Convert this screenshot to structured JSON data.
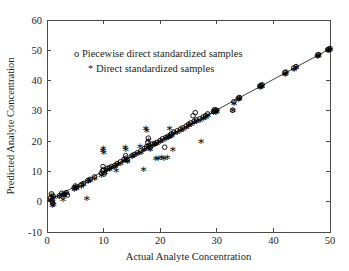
{
  "chart_data": {
    "type": "scatter",
    "title": "",
    "xlabel": "Actual Analyte Concentration",
    "ylabel": "Predicted Analyte Concentration",
    "xlim": [
      0,
      50
    ],
    "ylim": [
      -10,
      60
    ],
    "xticks": [
      0,
      10,
      20,
      30,
      40,
      50
    ],
    "yticks": [
      -10,
      0,
      10,
      20,
      30,
      40,
      50,
      60
    ],
    "xtick_labels": [
      "0",
      "10",
      "20",
      "30",
      "40",
      "50"
    ],
    "ytick_labels": [
      "-10",
      "0",
      "10",
      "20",
      "30",
      "40",
      "50",
      "60"
    ],
    "grid": false,
    "legend_position": "upper-left-inside",
    "legend": [
      {
        "marker": "o",
        "label": "Piecewise direct standardized samples"
      },
      {
        "marker": "*",
        "label": "Direct standardized samples"
      }
    ],
    "reference_line": {
      "type": "identity",
      "x": [
        0,
        50
      ],
      "y": [
        0,
        50.5
      ]
    },
    "series": [
      {
        "name": "Piecewise direct standardized samples",
        "marker": "o",
        "points": [
          [
            0.6,
            1.2
          ],
          [
            0.8,
            2.6
          ],
          [
            0.9,
            0.2
          ],
          [
            1.0,
            -0.6
          ],
          [
            1.1,
            1.8
          ],
          [
            2.2,
            2.0
          ],
          [
            2.6,
            2.8
          ],
          [
            3.0,
            2.4
          ],
          [
            3.4,
            3.0
          ],
          [
            3.6,
            2.2
          ],
          [
            4.8,
            4.6
          ],
          [
            5.0,
            5.2
          ],
          [
            5.2,
            4.8
          ],
          [
            6.0,
            5.6
          ],
          [
            6.4,
            6.0
          ],
          [
            7.2,
            7.0
          ],
          [
            7.6,
            7.4
          ],
          [
            8.4,
            8.2
          ],
          [
            9.6,
            9.4
          ],
          [
            9.8,
            10.2
          ],
          [
            9.9,
            11.6
          ],
          [
            10.0,
            10.6
          ],
          [
            10.1,
            9.2
          ],
          [
            10.6,
            11.0
          ],
          [
            11.0,
            11.2
          ],
          [
            11.4,
            11.6
          ],
          [
            12.0,
            12.0
          ],
          [
            12.4,
            12.6
          ],
          [
            13.0,
            13.2
          ],
          [
            13.6,
            14.0
          ],
          [
            13.9,
            15.2
          ],
          [
            14.0,
            14.4
          ],
          [
            14.2,
            13.8
          ],
          [
            15.0,
            15.2
          ],
          [
            15.4,
            15.6
          ],
          [
            16.0,
            16.2
          ],
          [
            16.6,
            16.8
          ],
          [
            17.2,
            17.6
          ],
          [
            17.6,
            18.2
          ],
          [
            17.8,
            19.6
          ],
          [
            17.9,
            21.0
          ],
          [
            18.0,
            18.6
          ],
          [
            18.2,
            17.8
          ],
          [
            18.6,
            19.0
          ],
          [
            19.0,
            19.2
          ],
          [
            19.4,
            19.6
          ],
          [
            20.0,
            20.2
          ],
          [
            20.4,
            20.8
          ],
          [
            20.8,
            18.0
          ],
          [
            21.0,
            21.2
          ],
          [
            21.4,
            21.6
          ],
          [
            21.8,
            22.0
          ],
          [
            22.0,
            22.4
          ],
          [
            22.4,
            23.0
          ],
          [
            23.0,
            23.4
          ],
          [
            23.6,
            24.0
          ],
          [
            24.0,
            24.4
          ],
          [
            24.6,
            25.0
          ],
          [
            25.0,
            25.6
          ],
          [
            25.4,
            26.0
          ],
          [
            25.8,
            28.4
          ],
          [
            26.0,
            26.6
          ],
          [
            26.2,
            29.4
          ],
          [
            26.4,
            27.0
          ],
          [
            27.0,
            27.4
          ],
          [
            27.6,
            28.0
          ],
          [
            28.0,
            28.4
          ],
          [
            28.4,
            29.0
          ],
          [
            29.4,
            29.8
          ],
          [
            29.6,
            30.4
          ],
          [
            29.8,
            30.0
          ],
          [
            30.0,
            30.2
          ],
          [
            32.8,
            30.2
          ],
          [
            33.0,
            33.0
          ],
          [
            33.8,
            34.2
          ],
          [
            34.0,
            34.4
          ],
          [
            37.6,
            38.2
          ],
          [
            37.8,
            38.4
          ],
          [
            38.0,
            38.6
          ],
          [
            42.0,
            42.6
          ],
          [
            42.2,
            42.8
          ],
          [
            43.6,
            44.2
          ],
          [
            44.0,
            44.6
          ],
          [
            47.8,
            48.4
          ],
          [
            48.0,
            48.6
          ],
          [
            49.6,
            50.2
          ],
          [
            49.8,
            50.4
          ],
          [
            50.0,
            50.6
          ]
        ]
      },
      {
        "name": "Direct standardized samples",
        "marker": "*",
        "points": [
          [
            0.6,
            1.0
          ],
          [
            0.7,
            2.4
          ],
          [
            0.9,
            -1.0
          ],
          [
            1.0,
            0.4
          ],
          [
            1.1,
            -0.8
          ],
          [
            1.2,
            1.6
          ],
          [
            2.2,
            1.8
          ],
          [
            2.6,
            2.6
          ],
          [
            2.8,
            1.0
          ],
          [
            3.0,
            2.2
          ],
          [
            3.4,
            2.8
          ],
          [
            4.8,
            4.4
          ],
          [
            5.0,
            5.0
          ],
          [
            5.2,
            4.6
          ],
          [
            6.0,
            5.4
          ],
          [
            6.4,
            5.8
          ],
          [
            7.0,
            1.4
          ],
          [
            7.2,
            6.8
          ],
          [
            7.6,
            7.2
          ],
          [
            8.4,
            8.0
          ],
          [
            9.6,
            9.0
          ],
          [
            9.8,
            17.2
          ],
          [
            9.9,
            17.8
          ],
          [
            10.0,
            16.6
          ],
          [
            10.1,
            10.0
          ],
          [
            10.2,
            9.8
          ],
          [
            10.6,
            10.8
          ],
          [
            11.0,
            11.0
          ],
          [
            11.4,
            11.4
          ],
          [
            12.0,
            11.8
          ],
          [
            12.2,
            10.6
          ],
          [
            12.4,
            12.4
          ],
          [
            13.0,
            13.0
          ],
          [
            13.6,
            13.8
          ],
          [
            13.8,
            18.0
          ],
          [
            13.9,
            17.4
          ],
          [
            14.0,
            14.2
          ],
          [
            14.2,
            13.6
          ],
          [
            15.0,
            15.0
          ],
          [
            15.4,
            15.4
          ],
          [
            16.0,
            16.0
          ],
          [
            16.4,
            18.4
          ],
          [
            16.6,
            16.6
          ],
          [
            17.0,
            10.8
          ],
          [
            17.2,
            17.4
          ],
          [
            17.4,
            24.4
          ],
          [
            17.6,
            23.6
          ],
          [
            17.8,
            18.0
          ],
          [
            17.9,
            20.6
          ],
          [
            18.0,
            18.4
          ],
          [
            18.2,
            17.6
          ],
          [
            18.6,
            18.8
          ],
          [
            19.0,
            19.0
          ],
          [
            19.2,
            14.6
          ],
          [
            19.4,
            19.4
          ],
          [
            19.6,
            14.4
          ],
          [
            20.0,
            20.0
          ],
          [
            20.2,
            14.8
          ],
          [
            20.4,
            20.6
          ],
          [
            20.6,
            14.6
          ],
          [
            21.0,
            21.0
          ],
          [
            21.2,
            14.8
          ],
          [
            21.4,
            21.4
          ],
          [
            21.6,
            24.4
          ],
          [
            21.8,
            21.8
          ],
          [
            22.0,
            22.2
          ],
          [
            22.2,
            17.6
          ],
          [
            22.4,
            22.8
          ],
          [
            23.0,
            23.2
          ],
          [
            23.6,
            23.8
          ],
          [
            24.0,
            24.2
          ],
          [
            24.6,
            24.8
          ],
          [
            25.0,
            25.4
          ],
          [
            25.4,
            25.8
          ],
          [
            26.0,
            26.4
          ],
          [
            26.4,
            26.8
          ],
          [
            27.0,
            27.2
          ],
          [
            27.2,
            20.0
          ],
          [
            27.6,
            27.8
          ],
          [
            28.0,
            28.2
          ],
          [
            28.4,
            28.8
          ],
          [
            29.4,
            29.6
          ],
          [
            29.6,
            30.2
          ],
          [
            29.8,
            29.8
          ],
          [
            30.0,
            30.0
          ],
          [
            32.8,
            30.4
          ],
          [
            33.0,
            32.8
          ],
          [
            33.8,
            34.0
          ],
          [
            34.0,
            34.2
          ],
          [
            37.6,
            38.0
          ],
          [
            37.8,
            38.2
          ],
          [
            38.0,
            38.4
          ],
          [
            42.0,
            42.4
          ],
          [
            42.2,
            42.6
          ],
          [
            43.6,
            44.0
          ],
          [
            44.0,
            44.4
          ],
          [
            47.8,
            48.2
          ],
          [
            48.0,
            48.4
          ],
          [
            49.6,
            50.0
          ],
          [
            49.8,
            50.2
          ],
          [
            50.0,
            50.4
          ]
        ]
      }
    ]
  }
}
